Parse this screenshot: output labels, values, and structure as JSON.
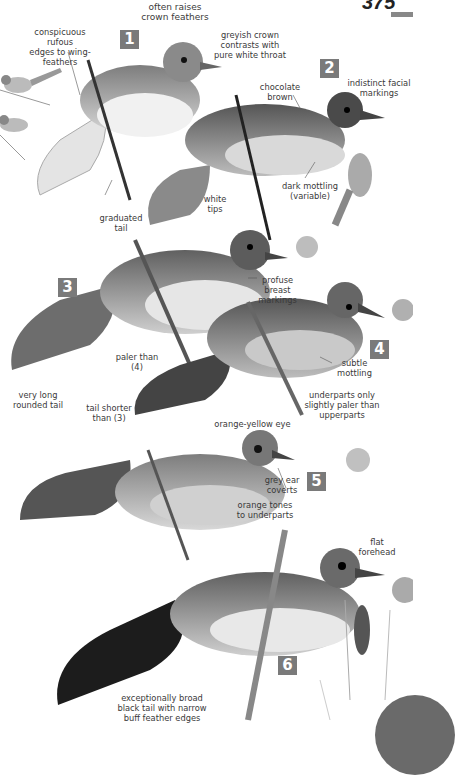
{
  "page": {
    "number": "375"
  },
  "plates": [
    {
      "number": "1"
    },
    {
      "number": "2"
    },
    {
      "number": "3"
    },
    {
      "number": "4"
    },
    {
      "number": "5"
    },
    {
      "number": "6"
    }
  ],
  "annotations": {
    "crown_feathers": [
      "often raises",
      "crown feathers"
    ],
    "rufous_edges": [
      "conspicuous rufous",
      "edges to wing-",
      "feathers"
    ],
    "greyish_crown": [
      "greyish crown",
      "contrasts with",
      "pure white throat"
    ],
    "chocolate": [
      "chocolate",
      "brown"
    ],
    "facial": [
      "indistinct facial",
      "markings"
    ],
    "white_tips": [
      "white",
      "tips"
    ],
    "dark_mottling": [
      "dark mottling",
      "(variable)"
    ],
    "graduated": [
      "graduated",
      "tail"
    ],
    "profuse": [
      "profuse",
      "breast",
      "markings"
    ],
    "paler_than": [
      "paler than",
      "(4)"
    ],
    "subtle": [
      "subtle",
      "mottling"
    ],
    "very_long": [
      "very long",
      "rounded tail"
    ],
    "tail_shorter": [
      "tail shorter",
      "than (3)"
    ],
    "underparts": [
      "underparts only",
      "slightly paler than",
      "upperparts"
    ],
    "orange_eye": [
      "orange-yellow eye"
    ],
    "grey_ear": [
      "grey ear",
      "coverts"
    ],
    "orange_tones": [
      "orange tones",
      "to underparts"
    ],
    "flat": [
      "flat",
      "forehead"
    ],
    "broad_tail": [
      "exceptionally broad",
      "black tail with narrow",
      "buff feather edges"
    ]
  },
  "colors": {
    "badge": "#7a7a7a",
    "text": "#3a3a3a",
    "egg": "#b5b5b5"
  }
}
